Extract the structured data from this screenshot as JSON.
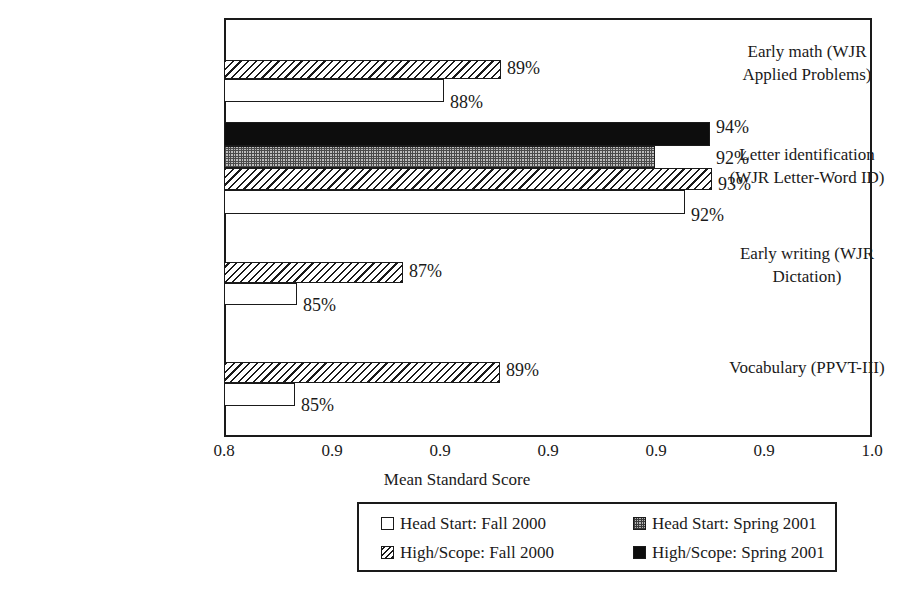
{
  "chart_data": {
    "type": "bar",
    "orientation": "horizontal",
    "title": "",
    "xlabel": "Mean Standard Score",
    "ylabel": "",
    "xlim": [
      0.8,
      1.0
    ],
    "grid": false,
    "legend_position": "bottom",
    "tick_labels": [
      "0.8",
      "0.9",
      "0.9",
      "0.9",
      "0.9",
      "0.9",
      "1.0"
    ],
    "tick_values": [
      0.8,
      0.85,
      0.9,
      0.9,
      0.9,
      0.95,
      1.0
    ],
    "categories": [
      "Early math (WJR Applied Problems)",
      "Letter identification (WJR Letter-Word ID)",
      "Early writing (WJR Dictation)",
      "Vocabulary (PPVT-III)"
    ],
    "category_lines": [
      [
        "Early math (WJR",
        "Applied Problems)"
      ],
      [
        "Letter identification",
        "(WJR Letter-Word ID)"
      ],
      [
        "Early writing (WJR",
        "Dictation)"
      ],
      [
        "Vocabulary (PPVT-III)"
      ]
    ],
    "series": [
      {
        "name": "Head Start: Fall 2000",
        "pattern": "white",
        "values": [
          0.88,
          0.92,
          0.85,
          0.85
        ],
        "labels": [
          "88%",
          "92%",
          "85%",
          "85%"
        ]
      },
      {
        "name": "Head Start: Spring 2001",
        "pattern": "check",
        "values": [
          null,
          0.92,
          null,
          null
        ],
        "labels": [
          "",
          "92%",
          "",
          ""
        ]
      },
      {
        "name": "High/Scope: Fall 2000",
        "pattern": "hatch",
        "values": [
          0.89,
          0.93,
          0.87,
          0.89
        ],
        "labels": [
          "89%",
          "93%",
          "87%",
          "89%"
        ]
      },
      {
        "name": "High/Scope: Spring 2001",
        "pattern": "black",
        "values": [
          null,
          0.94,
          null,
          null
        ],
        "labels": [
          "",
          "94%",
          "",
          ""
        ]
      }
    ],
    "bars": [
      {
        "id": "bar-math-hs-spring",
        "series": "High/Scope: Fall 2000",
        "category": "Early math (WJR Applied Problems)",
        "pattern": "hatch",
        "label": "89%",
        "left": 224,
        "top": 60,
        "width": 277,
        "height": 19,
        "label_x": 507,
        "label_y": 59
      },
      {
        "id": "bar-math-head-fall",
        "series": "Head Start: Fall 2000",
        "category": "Early math (WJR Applied Problems)",
        "pattern": "white",
        "label": "88%",
        "left": 224,
        "top": 79,
        "width": 220,
        "height": 23,
        "label_x": 450,
        "label_y": 93
      },
      {
        "id": "bar-letter-hs-spr",
        "series": "High/Scope: Spring 2001",
        "category": "Letter identification (WJR Letter-Word ID)",
        "pattern": "black",
        "label": "94%",
        "left": 224,
        "top": 122,
        "width": 486,
        "height": 24,
        "label_x": 716,
        "label_y": 118
      },
      {
        "id": "bar-letter-head-spr",
        "series": "Head Start: Spring 2001",
        "category": "Letter identification (WJR Letter-Word ID)",
        "pattern": "check",
        "label": "92%",
        "left": 224,
        "top": 146,
        "width": 431,
        "height": 22,
        "label_x": 716,
        "label_y": 149
      },
      {
        "id": "bar-letter-hs-fall",
        "series": "High/Scope: Fall 2000",
        "category": "Letter identification (WJR Letter-Word ID)",
        "pattern": "hatch",
        "label": "93%",
        "left": 224,
        "top": 168,
        "width": 488,
        "height": 22,
        "label_x": 718,
        "label_y": 175
      },
      {
        "id": "bar-letter-head-fall",
        "series": "Head Start: Fall 2000",
        "category": "Letter identification (WJR Letter-Word ID)",
        "pattern": "white",
        "label": "92%",
        "left": 224,
        "top": 190,
        "width": 461,
        "height": 24,
        "label_x": 691,
        "label_y": 206
      },
      {
        "id": "bar-write-hs-fall",
        "series": "High/Scope: Fall 2000",
        "category": "Early writing (WJR Dictation)",
        "pattern": "hatch",
        "label": "87%",
        "left": 224,
        "top": 262,
        "width": 179,
        "height": 21,
        "label_x": 409,
        "label_y": 262
      },
      {
        "id": "bar-write-head-fall",
        "series": "Head Start: Fall 2000",
        "category": "Early writing (WJR Dictation)",
        "pattern": "white",
        "label": "85%",
        "left": 224,
        "top": 283,
        "width": 73,
        "height": 22,
        "label_x": 303,
        "label_y": 296
      },
      {
        "id": "bar-vocab-hs-fall",
        "series": "High/Scope: Fall 2000",
        "category": "Vocabulary (PPVT-III)",
        "pattern": "hatch",
        "label": "89%",
        "left": 224,
        "top": 362,
        "width": 276,
        "height": 21,
        "label_x": 506,
        "label_y": 361
      },
      {
        "id": "bar-vocab-head-fall",
        "series": "Head Start: Fall 2000",
        "category": "Vocabulary (PPVT-III)",
        "pattern": "white",
        "label": "85%",
        "left": 224,
        "top": 383,
        "width": 71,
        "height": 23,
        "label_x": 301,
        "label_y": 396
      }
    ]
  },
  "legend": {
    "items": [
      {
        "label": "Head Start: Fall 2000",
        "pattern": "white"
      },
      {
        "label": "Head Start: Spring 2001",
        "pattern": "check"
      },
      {
        "label": "High/Scope: Fall 2000",
        "pattern": "hatch"
      },
      {
        "label": "High/Scope: Spring 2001",
        "pattern": "black"
      }
    ]
  },
  "colors": {
    "ink": "#1a1a1a",
    "background": "#ffffff",
    "black_series": "#0d0d0d",
    "check_series": "#bdbdbd"
  }
}
